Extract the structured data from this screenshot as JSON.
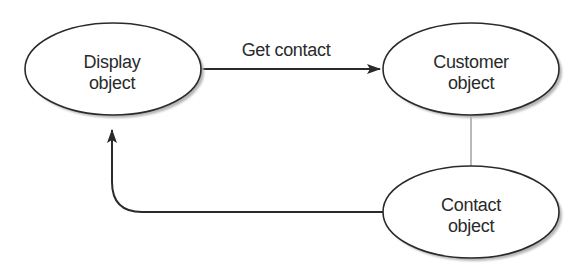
{
  "diagram": {
    "type": "object-interaction",
    "colors": {
      "stroke": "#2a2a2a",
      "text": "#2a2a2a",
      "shadow": "#b5b5b5",
      "connector": "#8a8a8a",
      "background": "#ffffff"
    },
    "nodes": [
      {
        "id": "display",
        "line1": "Display",
        "line2": "object",
        "cx": 113,
        "cy": 69,
        "rx": 88,
        "ry": 46
      },
      {
        "id": "customer",
        "line1": "Customer",
        "line2": "object",
        "cx": 471,
        "cy": 69,
        "rx": 88,
        "ry": 46
      },
      {
        "id": "contact",
        "line1": "Contact",
        "line2": "object",
        "cx": 471,
        "cy": 212,
        "rx": 88,
        "ry": 46
      }
    ],
    "edges": [
      {
        "id": "get-contact",
        "from": "display",
        "to": "customer",
        "label": "Get contact",
        "directed": true
      },
      {
        "id": "customer-contact",
        "from": "customer",
        "to": "contact",
        "label": "",
        "directed": false
      },
      {
        "id": "contact-to-display",
        "from": "contact",
        "to": "display",
        "label": "",
        "directed": true
      }
    ]
  }
}
